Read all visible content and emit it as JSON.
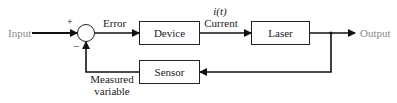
{
  "diagram": {
    "type": "feedback-control-block-diagram",
    "input_label": "Input",
    "output_label": "Output",
    "summing_junction": {
      "plus_sign": "+",
      "minus_sign": "−"
    },
    "error_label": "Error",
    "current_symbol": "i(t)",
    "current_label": "Current",
    "blocks": [
      {
        "id": "device",
        "label": "Device"
      },
      {
        "id": "laser",
        "label": "Laser"
      },
      {
        "id": "sensor",
        "label": "Sensor"
      }
    ],
    "feedback_label_line1": "Measured",
    "feedback_label_line2": "variable",
    "colors": {
      "line": "#111111",
      "box_border": "#222222",
      "io_text": "#8a8a8a",
      "label_text": "#1a1a1a"
    }
  }
}
